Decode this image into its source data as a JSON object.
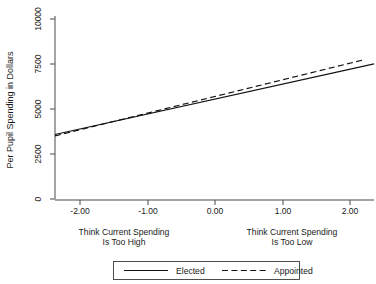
{
  "chart_data": {
    "type": "line",
    "title": "",
    "xlabel": "",
    "ylabel": "Per Pupil Spending in Dollars",
    "xlim": [
      -2.35,
      2.75
    ],
    "ylim": [
      0,
      10000
    ],
    "grid": false,
    "legend_position": "bottom-center",
    "x_ticks": [
      -2.0,
      -1.0,
      0.0,
      1.0,
      2.0
    ],
    "x_tick_labels": [
      "-2.00",
      "-1.00",
      "0.00",
      "1.00",
      "2.00"
    ],
    "y_ticks": [
      0,
      2500,
      5000,
      7500,
      10000
    ],
    "y_tick_labels": [
      "0",
      "2500",
      "5000",
      "7500",
      "10000"
    ],
    "x_axis_annotations": [
      {
        "position": "left",
        "line1": "Think Current Spending",
        "line2": "Is Too High"
      },
      {
        "position": "right",
        "line1": "Think Current Spending",
        "line2": "Is Too Low"
      }
    ],
    "series": [
      {
        "name": "Elected",
        "style": "solid",
        "color": "#111111",
        "x": [
          -2.35,
          2.75
        ],
        "values": [
          3620,
          7520
        ]
      },
      {
        "name": "Appointed",
        "style": "dashed",
        "color": "#111111",
        "x": [
          -2.35,
          2.6
        ],
        "values": [
          3540,
          7760
        ]
      }
    ]
  },
  "legend": {
    "entries": [
      {
        "label": "Elected",
        "style": "solid"
      },
      {
        "label": "Appointed",
        "style": "dashed"
      }
    ]
  }
}
